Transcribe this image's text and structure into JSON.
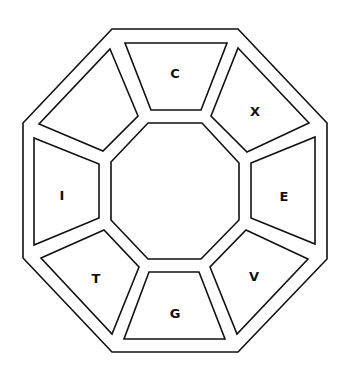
{
  "diagram": {
    "title": "",
    "shape": "octagon",
    "colors": {
      "stroke": "#111111",
      "fill": "#ffffff",
      "text": "#111111"
    },
    "outer_octagon": [
      [
        112,
        29
      ],
      [
        238,
        29
      ],
      [
        327,
        123
      ],
      [
        327,
        259
      ],
      [
        238,
        352
      ],
      [
        112,
        352
      ],
      [
        23,
        258
      ],
      [
        23,
        123
      ]
    ],
    "inner_octagon": [
      [
        148,
        123
      ],
      [
        202,
        123
      ],
      [
        239,
        163
      ],
      [
        239,
        220
      ],
      [
        201,
        259
      ],
      [
        148,
        259
      ],
      [
        111,
        220
      ],
      [
        111,
        162
      ]
    ],
    "panels": [
      {
        "id": "top",
        "label": "C",
        "label_pos": [
          175,
          73
        ],
        "points": [
          [
            125,
            43
          ],
          [
            227,
            43
          ],
          [
            201,
            110
          ],
          [
            151,
            110
          ]
        ]
      },
      {
        "id": "top-right",
        "label": "X",
        "label_pos": [
          255,
          111
        ],
        "points": [
          [
            238,
            48
          ],
          [
            309,
            123
          ],
          [
            247,
            152
          ],
          [
            211,
            116
          ]
        ]
      },
      {
        "id": "right",
        "label": "E",
        "label_pos": [
          284,
          196
        ],
        "points": [
          [
            251,
            163
          ],
          [
            315,
            137
          ],
          [
            315,
            244
          ],
          [
            251,
            218
          ]
        ]
      },
      {
        "id": "bottom-right",
        "label": "V",
        "label_pos": [
          254,
          276
        ],
        "points": [
          [
            246,
            230
          ],
          [
            308,
            259
          ],
          [
            237,
            334
          ],
          [
            210,
            267
          ]
        ]
      },
      {
        "id": "bottom",
        "label": "G",
        "label_pos": [
          175,
          313
        ],
        "points": [
          [
            149,
            272
          ],
          [
            199,
            272
          ],
          [
            225,
            339
          ],
          [
            124,
            339
          ]
        ]
      },
      {
        "id": "bottom-left",
        "label": "T",
        "label_pos": [
          96,
          278
        ],
        "points": [
          [
            41,
            258
          ],
          [
            104,
            230
          ],
          [
            139,
            267
          ],
          [
            112,
            334
          ]
        ]
      },
      {
        "id": "left",
        "label": "I",
        "label_pos": [
          62,
          195
        ],
        "points": [
          [
            34,
            138
          ],
          [
            99,
            164
          ],
          [
            99,
            218
          ],
          [
            34,
            245
          ]
        ]
      },
      {
        "id": "top-left",
        "label": "",
        "label_pos": [
          95,
          110
        ],
        "points": [
          [
            110,
            49
          ],
          [
            138,
            116
          ],
          [
            103,
            151
          ],
          [
            39,
            124
          ]
        ]
      }
    ]
  }
}
